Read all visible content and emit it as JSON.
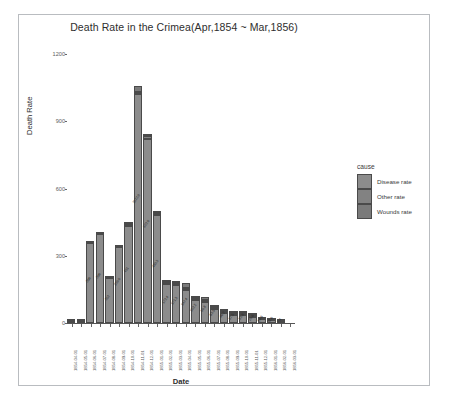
{
  "chart_data": {
    "type": "bar",
    "title": "Death Rate in the Crimea(Apr,1854 ~ Mar,1856)",
    "xlabel": "Date",
    "ylabel": "Death Rate",
    "ylim": [
      0,
      1250
    ],
    "yticks": [
      0,
      300,
      600,
      900,
      1200
    ],
    "grid": false,
    "stacked": true,
    "legend_title": "cause",
    "legend_position": "right",
    "categories": [
      "1854-04-01",
      "1854-05-01",
      "1854-06-01",
      "1854-07-01",
      "1854-08-01",
      "1854-09-01",
      "1854-10-01",
      "1854-11-01",
      "1854-12-01",
      "1855-01-01",
      "1855-02-01",
      "1855-03-01",
      "1855-04-01",
      "1855-05-01",
      "1855-06-01",
      "1855-07-01",
      "1855-08-01",
      "1855-09-01",
      "1855-10-01",
      "1855-11-01",
      "1855-12-01",
      "1856-01-01",
      "1856-02-01",
      "1856-03-01"
    ],
    "series": [
      {
        "name": "Wounds rate",
        "values": [
          0.0,
          0.0,
          0.0,
          0.0,
          0.0,
          0.0,
          10.1,
          27.0,
          9.2,
          8.4,
          6.1,
          7.4,
          20.6,
          10.5,
          13.6,
          8.9,
          6.5,
          3.0,
          1.0,
          0.5,
          0.0,
          0.0,
          0.0,
          0.0
        ]
      },
      {
        "name": "Other rate",
        "values": [
          4.6,
          4.3,
          2.9,
          1.1,
          3.6,
          4.7,
          5.2,
          6.0,
          11.4,
          8.2,
          7.1,
          5.8,
          6.1,
          6.1,
          5.4,
          3.9,
          3.5,
          4.6,
          5.0,
          4.2,
          3.5,
          2.4,
          2.0,
          0.0
        ]
      },
      {
        "name": "Disease rate",
        "values": [
          1.4,
          6.2,
          356.0,
          396.0,
          202.0,
          339.8,
          431.0,
          1022.8,
          822.8,
          480.3,
          172.4,
          171.3,
          147.4,
          102.2,
          95.8,
          63.5,
          46.2,
          37.5,
          33.8,
          25.6,
          18.6,
          11.6,
          7.4,
          0.0
        ]
      }
    ],
    "bar_value_labels": [
      "",
      "",
      "356",
      "396",
      "202",
      "339.8",
      "431",
      "1022.8",
      "822.8",
      "480.3",
      "172.4",
      "171.3",
      "147.4",
      "102.2",
      "95.8",
      "63.5",
      "46.2",
      "37.5",
      "33.8",
      "25.6",
      "18.6",
      "11.6",
      "7.4",
      ""
    ],
    "legend_entries": [
      "Disease rate",
      "Other rate",
      "Wounds rate"
    ],
    "colors": {
      "disease": "#8c8c8c",
      "other": "#828282",
      "wounds": "#7a7a7a",
      "border": "#4a4a4a",
      "panel": "#ffffff",
      "axis": "#555555",
      "text": "#3a3a3a"
    }
  }
}
